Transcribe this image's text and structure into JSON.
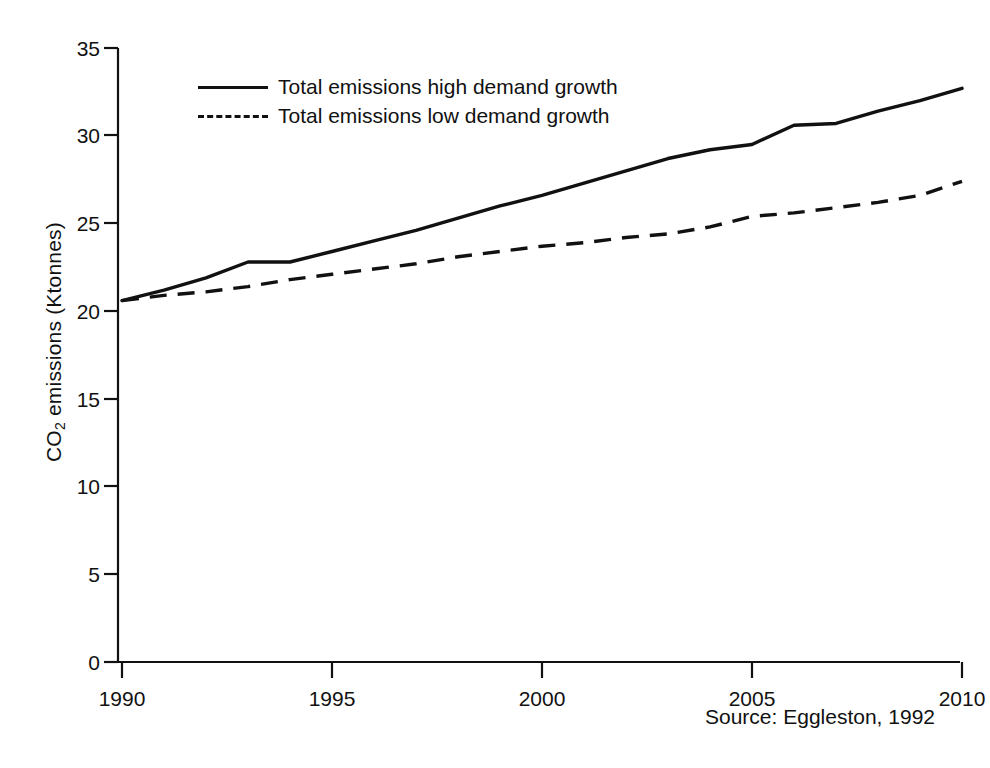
{
  "chart_data": {
    "type": "line",
    "title": "",
    "xlabel": "",
    "ylabel": "CO2 emissions (Ktonnes)",
    "ylabel_base": "CO",
    "ylabel_sub": "2",
    "ylabel_rest": " emissions (Ktonnes)",
    "xlim": [
      1990,
      2010
    ],
    "ylim": [
      0,
      35
    ],
    "xticks": [
      1990,
      1995,
      2000,
      2005,
      2010
    ],
    "yticks": [
      0,
      5,
      10,
      15,
      20,
      25,
      30,
      35
    ],
    "grid": false,
    "legend_position": "upper-left-inside",
    "line_color": "#111111",
    "background_color": "#ffffff",
    "x": [
      1990,
      1991,
      1992,
      1993,
      1994,
      1995,
      1996,
      1997,
      1998,
      1999,
      2000,
      2001,
      2002,
      2003,
      2004,
      2005,
      2006,
      2007,
      2008,
      2009,
      2010
    ],
    "series": [
      {
        "name": "Total emissions high demand growth",
        "style": "solid",
        "values": [
          20.6,
          21.2,
          21.9,
          22.8,
          22.8,
          23.4,
          24.0,
          24.6,
          25.3,
          26.0,
          26.6,
          27.3,
          28.0,
          28.7,
          29.2,
          29.5,
          30.6,
          30.7,
          31.4,
          32.0,
          32.7
        ]
      },
      {
        "name": "Total emissions low demand growth",
        "style": "dashed",
        "values": [
          20.6,
          20.9,
          21.1,
          21.4,
          21.8,
          22.1,
          22.4,
          22.7,
          23.1,
          23.4,
          23.7,
          23.9,
          24.2,
          24.4,
          24.8,
          25.4,
          25.6,
          25.9,
          26.2,
          26.6,
          27.4
        ]
      }
    ],
    "annotations": [
      {
        "name": "source",
        "text": "Source: Eggleston, 1992"
      }
    ]
  },
  "legend": {
    "items": [
      {
        "label": "Total emissions high demand growth",
        "style": "solid"
      },
      {
        "label": "Total emissions low demand growth",
        "style": "dashed"
      }
    ]
  },
  "source": {
    "text": "Source: Eggleston, 1992"
  },
  "axes": {
    "y_tick_labels": [
      "35",
      "30",
      "25",
      "20",
      "15",
      "10",
      "5",
      "0"
    ],
    "x_tick_labels": [
      "1990",
      "1995",
      "2000",
      "2005",
      "2010"
    ]
  }
}
